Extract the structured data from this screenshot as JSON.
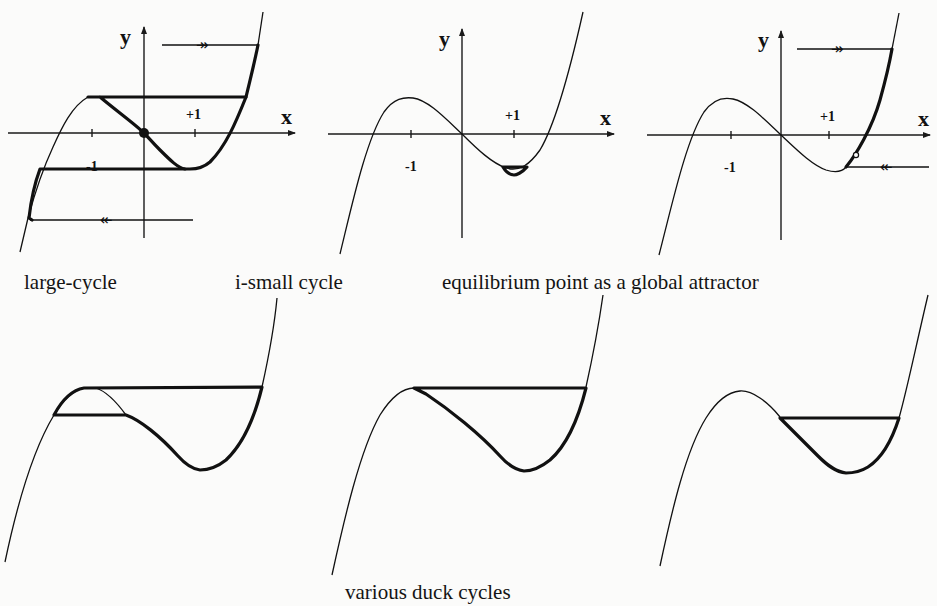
{
  "figure": {
    "top_row": {
      "panels": [
        {
          "id": "large-cycle",
          "axis_labels": {
            "x": "x",
            "y": "y"
          },
          "tick_labels": {
            "neg": "-1",
            "pos": "+1"
          },
          "caption": "large-cycle"
        },
        {
          "id": "i-small-cycle",
          "axis_labels": {
            "x": "x",
            "y": "y"
          },
          "tick_labels": {
            "neg": "-1",
            "pos": "+1"
          },
          "caption": "i-small cycle"
        },
        {
          "id": "equilibrium-global-attractor",
          "axis_labels": {
            "x": "x",
            "y": "y"
          },
          "tick_labels": {
            "neg": "-1",
            "pos": "+1"
          },
          "caption": "equilibrium point as a global attractor"
        }
      ]
    },
    "bottom_row": {
      "panel_count": 3,
      "caption": "various duck cycles"
    }
  },
  "colors": {
    "ink": "#111111",
    "paper": "#fbfbfa",
    "bleed_through": "#e2e2e0"
  }
}
